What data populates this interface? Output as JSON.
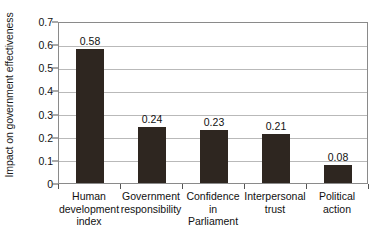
{
  "chart_data": {
    "type": "bar",
    "title": "",
    "subtitle": "",
    "xlabel": "",
    "ylabel": "Impact on government effectiveness",
    "ylim": [
      0,
      0.7
    ],
    "ytick_values": [
      0,
      0.1,
      0.2,
      0.3,
      0.4,
      0.5,
      0.6,
      0.7
    ],
    "ytick_labels": [
      "0",
      "0.1",
      "0.2",
      "0.3",
      "0.4",
      "0.5",
      "0.6",
      "0.7"
    ],
    "grid": "horizontal",
    "legend": "none",
    "bar_color": "#2e2620",
    "gridline_color": "#b9b9b9",
    "axis_color": "#8a8a8a",
    "categories": [
      "Human development index",
      "Government responsibility",
      "Confidence in Parliament",
      "Interpersonal trust",
      "Political action"
    ],
    "category_lines": [
      [
        "Human",
        "development",
        "index"
      ],
      [
        "Government",
        "responsibility"
      ],
      [
        "Confidence",
        "in",
        "Parliament"
      ],
      [
        "Interpersonal",
        "trust"
      ],
      [
        "Political",
        "action"
      ]
    ],
    "values": [
      0.58,
      0.24,
      0.23,
      0.21,
      0.08
    ],
    "data_labels": [
      "0.58",
      "0.24",
      "0.23",
      "0.21",
      "0.08"
    ]
  }
}
